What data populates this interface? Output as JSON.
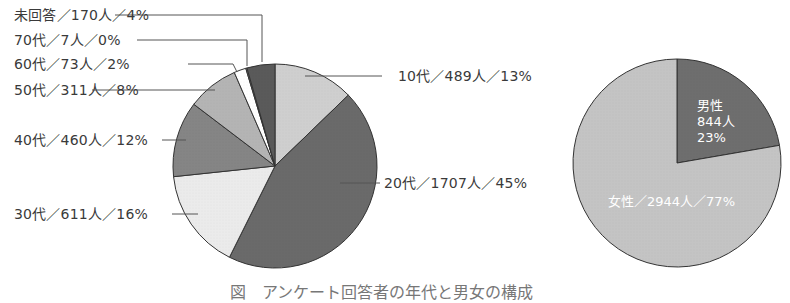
{
  "chart_data": [
    {
      "type": "pie",
      "title": "",
      "categories": [
        "10代",
        "20代",
        "30代",
        "40代",
        "50代",
        "60代",
        "70代",
        "未回答"
      ],
      "values": [
        489,
        1707,
        611,
        460,
        311,
        73,
        7,
        170
      ],
      "percentages": [
        13,
        45,
        16,
        12,
        8,
        2,
        0,
        4
      ],
      "labels": [
        "10代／489人／13%",
        "20代／1707人／45%",
        "30代／611人／16%",
        "40代／460人／12%",
        "50代／311人／8%",
        "60代／73人／2%",
        "70代／7人／0%",
        "未回答／170人／4%"
      ],
      "colors": [
        "#cfcfcf",
        "#6a6a6a",
        "#ebebeb",
        "#858585",
        "#b4b4b4",
        "#ffffff",
        "#9a9a9a",
        "#5a5a5a"
      ],
      "start_angle": "12 o'clock, clockwise",
      "legend": "none (callout labels)"
    },
    {
      "type": "pie",
      "title": "",
      "categories": [
        "男性",
        "女性"
      ],
      "values": [
        844,
        2944
      ],
      "percentages": [
        23,
        77
      ],
      "labels": [
        "男性\n844人\n23%",
        "女性／2944人／77%"
      ],
      "colors": [
        "#6e6e6e",
        "#c4c4c4"
      ],
      "start_angle": "12 o'clock, clockwise",
      "legend": "none (inside labels)"
    }
  ],
  "age_chart": {
    "labels": {
      "teens": "10代／489人／13%",
      "twenties": "20代／1707人／45%",
      "thirties": "30代／611人／16%",
      "forties": "40代／460人／12%",
      "fifties": "50代／311人／8%",
      "sixties": "60代／73人／2%",
      "seventies": "70代／7人／0%",
      "no_answer": "未回答／170人／4%"
    }
  },
  "gender_chart": {
    "male_line1": "男性",
    "male_line2": "844人",
    "male_line3": "23%",
    "female": "女性／2944人／77%"
  },
  "caption": "図　アンケート回答者の年代と男女の構成"
}
